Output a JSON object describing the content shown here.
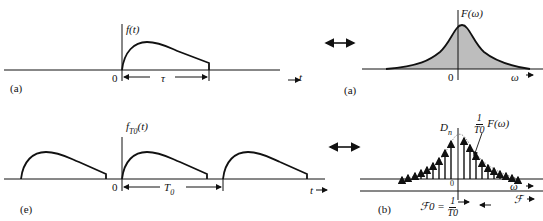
{
  "panels": {
    "top_left": {
      "caption": "(a)",
      "y_label": "f(t)",
      "origin_label": "0",
      "width_label": "τ",
      "x_axis_label": "t"
    },
    "top_right": {
      "caption": "(a)",
      "y_label": "F(ω)",
      "origin_label": "0",
      "x_axis_label": "ω",
      "fill_color": "#bdbdbd"
    },
    "bottom_left": {
      "caption": "(e)",
      "y_label_main": "f",
      "y_label_sub": "T0",
      "y_label_arg": "(t)",
      "origin_label": "0",
      "period_label_main": "T",
      "period_label_sub": "0",
      "x_axis_label": "t"
    },
    "bottom_right": {
      "caption": "(b)",
      "y_label_main": "D",
      "y_label_sub": "n",
      "envelope_num": "1",
      "envelope_den": "T0",
      "envelope_func": "F(ω)",
      "origin_label": "0",
      "x_axis_label_omega": "ω",
      "x_axis_label_freq": "ℱ",
      "freq_spacing_label": "ℱ0 =",
      "freq_spacing_num": "1",
      "freq_spacing_den": "T0"
    }
  },
  "arrows": {
    "transform_pair_symbol": "↔"
  }
}
